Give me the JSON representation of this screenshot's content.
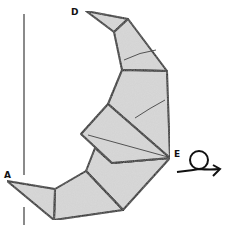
{
  "diagram": {
    "type": "origami-step",
    "labels": {
      "point_d": "D",
      "point_a": "A",
      "point_e": "E"
    },
    "symbols": {
      "turn_over": "turn-over-icon"
    },
    "colors": {
      "paper": "#d9d9d9",
      "outline": "#111111",
      "axis_line": "#8a8a8a"
    }
  }
}
